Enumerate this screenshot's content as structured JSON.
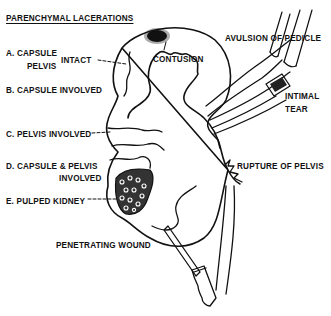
{
  "diagram": {
    "title": "PARENCHYMAL LACERATIONS",
    "laceration_types": [
      {
        "id": "A",
        "line1": "A. CAPSULE",
        "line2": "PELVIS",
        "qualifier": "INTACT"
      },
      {
        "id": "B",
        "label": "B. CAPSULE INVOLVED"
      },
      {
        "id": "C",
        "label": "C. PELVIS INVOLVED"
      },
      {
        "id": "D",
        "line1": "D. CAPSULE & PELVIS",
        "line2": "INVOLVED"
      },
      {
        "id": "E",
        "label": "E. PULPED KIDNEY"
      }
    ],
    "injuries": {
      "contusion": "CONTUSION",
      "avulsion": "AVULSION OF PEDICLE",
      "intimal_tear_line1": "INTIMAL",
      "intimal_tear_line2": "TEAR",
      "rupture_pelvis": "RUPTURE OF PELVIS",
      "penetrating_wound": "PENETRATING WOUND"
    },
    "colors": {
      "ink": "#111111",
      "background": "#ffffff"
    }
  }
}
